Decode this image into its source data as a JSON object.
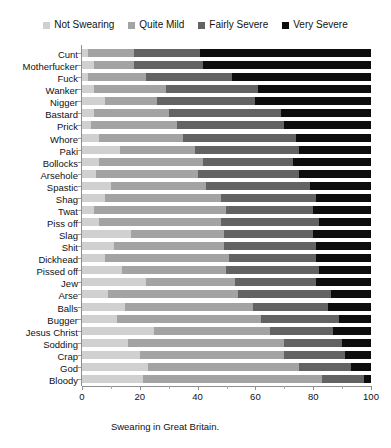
{
  "chart_data": {
    "type": "bar",
    "subtype": "stacked-horizontal-100",
    "title": "Swearing in Great Britain.",
    "xlabel": "",
    "ylabel": "",
    "xlim": [
      0,
      100
    ],
    "xticks": [
      0,
      20,
      40,
      60,
      80,
      100
    ],
    "xtick_labels": [
      "0",
      "20",
      "40",
      "60",
      "80",
      "100"
    ],
    "grid": false,
    "legend_position": "top",
    "legend": [
      "Not Swearing",
      "Quite Mild",
      "Fairly Severe",
      "Very Severe"
    ],
    "colors": {
      "not_swearing": "#d0d0d0",
      "quite_mild": "#a3a3a3",
      "fairly_severe": "#636363",
      "very_severe": "#0d0d0d"
    },
    "categories": [
      "Cunt",
      "Motherfucker",
      "Fuck",
      "Wanker",
      "Nigger",
      "Bastard",
      "Prick",
      "Whore",
      "Paki",
      "Bollocks",
      "Arsehole",
      "Spastic",
      "Shag",
      "Twat",
      "Piss off",
      "Slag",
      "Shit",
      "Dickhead",
      "Pissed off",
      "Jew",
      "Arse",
      "Balls",
      "Bugger",
      "Jesus Christ",
      "Sodding",
      "Crap",
      "God",
      "Bloody"
    ],
    "series": [
      {
        "name": "Not Swearing",
        "values": [
          2,
          4,
          2,
          4,
          8,
          4,
          3,
          6,
          13,
          6,
          5,
          10,
          8,
          4,
          6,
          17,
          11,
          8,
          14,
          22,
          9,
          15,
          12,
          25,
          16,
          20,
          23,
          21
        ]
      },
      {
        "name": "Quite Mild",
        "values": [
          16,
          14,
          20,
          25,
          18,
          26,
          30,
          29,
          26,
          36,
          35,
          33,
          40,
          46,
          42,
          32,
          38,
          43,
          36,
          31,
          45,
          44,
          50,
          40,
          54,
          50,
          52,
          62
        ]
      },
      {
        "name": "Fairly Severe",
        "values": [
          23,
          24,
          30,
          32,
          34,
          39,
          37,
          39,
          36,
          31,
          35,
          36,
          33,
          30,
          34,
          31,
          32,
          30,
          32,
          28,
          32,
          26,
          27,
          22,
          20,
          21,
          18,
          14.5
        ]
      },
      {
        "name": "Very Severe",
        "values": [
          59,
          58,
          48,
          39,
          40,
          31,
          30,
          26,
          25,
          27,
          25,
          21,
          19,
          20,
          18,
          20,
          19,
          19,
          18,
          19,
          14,
          15,
          11,
          13,
          10,
          9,
          7,
          2.5
        ]
      }
    ]
  }
}
